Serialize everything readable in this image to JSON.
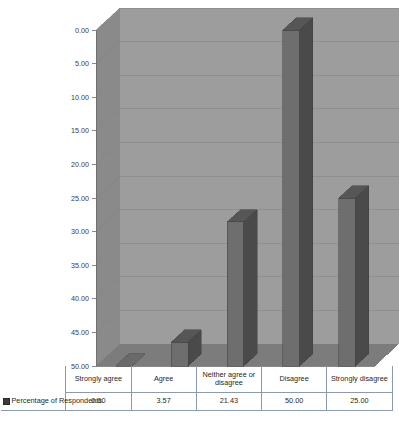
{
  "chart_data": {
    "type": "bar",
    "title": "",
    "xlabel": "",
    "ylabel": "",
    "categories": [
      "Strongly agree",
      "Agree",
      "Neither agree or disagree",
      "Disagree",
      "Strongly disagree"
    ],
    "series": [
      {
        "name": "Percentage of Respondents",
        "values": [
          0.0,
          3.57,
          21.43,
          50.0,
          25.0
        ]
      }
    ],
    "value_labels": [
      "0.00",
      "3.57",
      "21.43",
      "50.00",
      "25.00"
    ],
    "ylim": [
      0,
      50
    ],
    "ytick_step": 5,
    "ytick_labels": [
      "0.00",
      "5.00",
      "10.00",
      "15.00",
      "20.00",
      "25.00",
      "30.00",
      "35.00",
      "40.00",
      "45.00",
      "50.00"
    ],
    "grid": true,
    "legend_position": "table-row",
    "style": "3d-column",
    "colors": {
      "bar_front": "#6e6e6e",
      "bar_side": "#4a4a4a",
      "bar_top": "#565656",
      "back_wall": "#9d9d9d",
      "side_wall": "#8a8a8a",
      "floor": "#7c7c7c",
      "gridline": "#7f7f7f",
      "table_border": "#8a9bb0",
      "legend_swatch": "#3c3c3c"
    }
  },
  "table": {
    "legend_label": "Percentage of Respondents",
    "headers": [
      "Strongly agree",
      "Agree",
      "Neither agree or disagree",
      "Disagree",
      "Strongly disagree"
    ],
    "values": [
      "0.00",
      "3.57",
      "21.43",
      "50.00",
      "25.00"
    ]
  },
  "axis": {
    "ticks": [
      {
        "label": "50.00"
      },
      {
        "label": "45.00"
      },
      {
        "label": "40.00"
      },
      {
        "label": "35.00"
      },
      {
        "label": "30.00"
      },
      {
        "label": "25.00"
      },
      {
        "label": "20.00"
      },
      {
        "label": "15.00"
      },
      {
        "label": "10.00"
      },
      {
        "label": "5.00"
      },
      {
        "label": "0.00"
      }
    ]
  }
}
